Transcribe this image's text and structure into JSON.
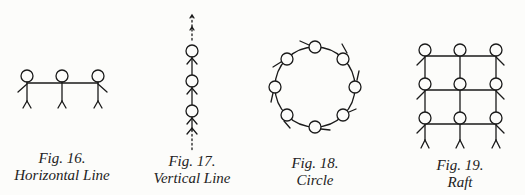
{
  "figures": [
    {
      "number": "Fig. 16.",
      "title": "Horizontal Line",
      "people": 3
    },
    {
      "number": "Fig. 17.",
      "title": "Vertical Line",
      "people": 3
    },
    {
      "number": "Fig. 18.",
      "title": "Circle",
      "people": 8
    },
    {
      "number": "Fig. 19.",
      "title": "Raft",
      "people": 9
    }
  ],
  "colors": {
    "ink": "#1a1a1a",
    "paper": "#fcfcfa"
  }
}
